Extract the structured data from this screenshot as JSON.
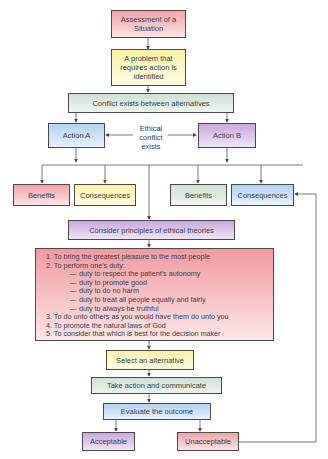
{
  "diagram": {
    "nodes": {
      "assessment": {
        "label": "Assessment of a Situation",
        "color": "#f4a3a8"
      },
      "problem": {
        "label": "A problem that requires action is identified",
        "color": "#fbf3a6"
      },
      "conflict": {
        "label": "Conflict exists between alternatives",
        "color": "#cfe0d3"
      },
      "action_a": {
        "label": "Action A",
        "color": "#b3d2f3"
      },
      "ethical_conflict": {
        "label": "Ethical conflict exists"
      },
      "action_b": {
        "label": "Action B",
        "color": "#c9a8dd"
      },
      "a_benefits": {
        "label": "Benefits",
        "color": "#f4a3a8"
      },
      "a_consequences": {
        "label": "Consequences",
        "color": "#fbf3a6"
      },
      "b_benefits": {
        "label": "Benefits",
        "color": "#cfe0d3"
      },
      "b_consequences": {
        "label": "Consequences",
        "color": "#b3d2f3"
      },
      "consider": {
        "label": "Consider principles of ethical theories",
        "color": "#c9a8dd"
      },
      "principles": {
        "items": [
          "1.  To bring the greatest pleasure to the most people",
          "2.  To perform one's duty:",
          "3.  To do unto others as you would have them do unto you",
          "4.  To promote the natural laws of God",
          "5.  To consider that which is best for the decision maker"
        ],
        "duties": [
          "duty to respect the patient's autonomy",
          "duty to promote good",
          "duty to do no harm",
          "duty to treat all people equally and fairly",
          "duty to always be truthful"
        ],
        "color": "#f19aa0"
      },
      "select": {
        "label": "Select an alternative",
        "color": "#fbf3a6"
      },
      "take_action": {
        "label": "Take action and communicate",
        "color": "#cfe0d3"
      },
      "evaluate": {
        "label": "Evaluate the outcome",
        "color": "#b3d2f3"
      },
      "acceptable": {
        "label": "Acceptable",
        "color": "#c9a8dd"
      },
      "unacceptable": {
        "label": "Unacceptable",
        "color": "#f4a3a8"
      }
    }
  }
}
